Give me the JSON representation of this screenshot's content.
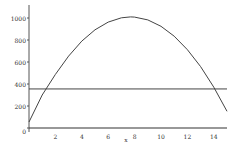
{
  "chart_data": {
    "type": "line",
    "title": "",
    "xlabel": "x",
    "ylabel": "",
    "xlim": [
      0,
      15
    ],
    "ylim": [
      0,
      1000
    ],
    "x_ticks": [
      "2",
      "4",
      "6",
      "8",
      "10",
      "12",
      "14"
    ],
    "y_ticks": [
      "0",
      "200",
      "400",
      "600",
      "800",
      "1000"
    ],
    "grid": false,
    "legend": null,
    "series": [
      {
        "name": "parabola",
        "type": "curve",
        "x": [
          0,
          1,
          2,
          3,
          4,
          5,
          6,
          7,
          7.7,
          8,
          9,
          10,
          11,
          12,
          13,
          14,
          15
        ],
        "values": [
          55,
          300,
          487,
          654,
          790,
          893,
          963,
          1002,
          1010,
          1008,
          983,
          925,
          835,
          712,
          558,
          371,
          152
        ]
      },
      {
        "name": "horizontal line",
        "type": "constant",
        "x": [
          0,
          15
        ],
        "values": [
          355,
          355
        ]
      },
      {
        "name": "baseline",
        "type": "constant",
        "x": [
          0,
          15
        ],
        "values": [
          0,
          0
        ]
      }
    ]
  },
  "axis": {
    "x_label": "x",
    "x_tick_labels": [
      "2",
      "4",
      "6",
      "8",
      "10",
      "12",
      "14"
    ],
    "y_tick_labels": [
      "0",
      "200",
      "400",
      "600",
      "800",
      "1000"
    ]
  }
}
